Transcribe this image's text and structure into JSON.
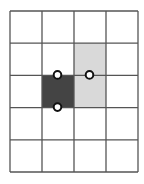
{
  "diagram": {
    "type": "grid",
    "cols": 4,
    "rows": 5,
    "origin": [
      10,
      11
    ],
    "cell_w": 32,
    "cell_h": 32.2,
    "line_color": "#555555",
    "line_width": 1.3,
    "background": "#ffffff",
    "filled_cells": [
      {
        "name": "light-gray-region",
        "col": 2,
        "row": 1,
        "colspan": 1,
        "rowspan": 2,
        "color": "#d9d9d9"
      },
      {
        "name": "dark-cell",
        "col": 1,
        "row": 2,
        "colspan": 1,
        "rowspan": 1,
        "color": "#444444"
      }
    ],
    "points": [
      {
        "name": "point-top-left",
        "col": 1.5,
        "row": 2
      },
      {
        "name": "point-top-right",
        "col": 2.5,
        "row": 2
      },
      {
        "name": "point-bottom",
        "col": 1.5,
        "row": 3
      }
    ],
    "point_radius": 3.8,
    "point_fill": "#ffffff",
    "point_stroke": "#111111",
    "point_stroke_width": 2
  }
}
